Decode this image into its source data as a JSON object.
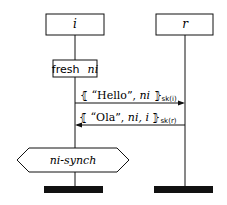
{
  "diagram": {
    "type": "message-sequence-chart",
    "roles": [
      {
        "id": "i",
        "label": "i"
      },
      {
        "id": "r",
        "label": "r"
      }
    ],
    "events": [
      {
        "kind": "fresh",
        "role": "i",
        "keyword": "fresh",
        "variable": "ni"
      },
      {
        "kind": "message",
        "from": "i",
        "to": "r",
        "open": "⦃",
        "content_prefix": " “Hello”, ",
        "content_var": "ni",
        "content_suffix": " ",
        "close": "⦄",
        "subscript": "sk(i)"
      },
      {
        "kind": "message",
        "from": "r",
        "to": "i",
        "open": "⦃",
        "content_prefix": " “Ola”, ",
        "content_var": "ni, i",
        "content_suffix": " ",
        "close": "⦄",
        "subscript": "sk(r)"
      },
      {
        "kind": "claim",
        "role": "i",
        "label": "ni-synch"
      }
    ],
    "colors": {
      "stroke": "#111111",
      "end_bar": "#111111",
      "background": "#ffffff"
    }
  }
}
